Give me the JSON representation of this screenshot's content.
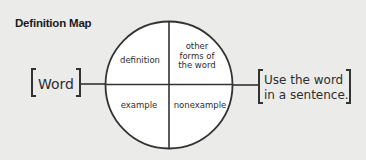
{
  "title": "Definition Map",
  "center_word": "Word",
  "quadrants": {
    "top_left": "definition",
    "top_right": [
      "other",
      "forms of",
      "the word"
    ],
    "bottom_left": "example",
    "bottom_right": "nonexample"
  },
  "sentence_box": [
    "Use the word",
    "in a sentence."
  ],
  "colors": {
    "background": "#ebebea",
    "line": "#333333",
    "circle_fill": "#ffffff",
    "text": "#2e2e2e"
  }
}
